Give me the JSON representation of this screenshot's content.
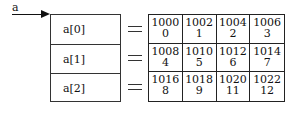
{
  "pointer": {
    "label": "a"
  },
  "rows": [
    {
      "label": "a[0]",
      "equals": "="
    },
    {
      "label": "a[1]",
      "equals": "="
    },
    {
      "label": "a[2]",
      "equals": "="
    }
  ],
  "grid": [
    [
      {
        "address": "1000",
        "value": "0"
      },
      {
        "address": "1002",
        "value": "1"
      },
      {
        "address": "1004",
        "value": "2"
      },
      {
        "address": "1006",
        "value": "3"
      }
    ],
    [
      {
        "address": "1008",
        "value": "4"
      },
      {
        "address": "1010",
        "value": "5"
      },
      {
        "address": "1012",
        "value": "6"
      },
      {
        "address": "1014",
        "value": "7"
      }
    ],
    [
      {
        "address": "1016",
        "value": "8"
      },
      {
        "address": "1018",
        "value": "9"
      },
      {
        "address": "1020",
        "value": "11"
      },
      {
        "address": "1022",
        "value": "12"
      }
    ]
  ]
}
